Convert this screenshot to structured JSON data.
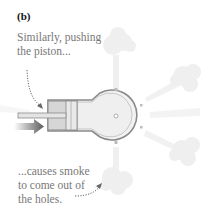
{
  "figure": {
    "panel_label": "(b)",
    "caption_top_line1": "Similarly, pushing",
    "caption_top_line2": "the piston...",
    "caption_bottom_line1": "...causes smoke",
    "caption_bottom_line2": "to come out of",
    "caption_bottom_line3": "the holes."
  },
  "colors": {
    "text": "#777777",
    "label": "#111111",
    "outline": "#999999",
    "fill": "#eeeeee",
    "smoke": "#ededed",
    "arrow": "#666666"
  }
}
